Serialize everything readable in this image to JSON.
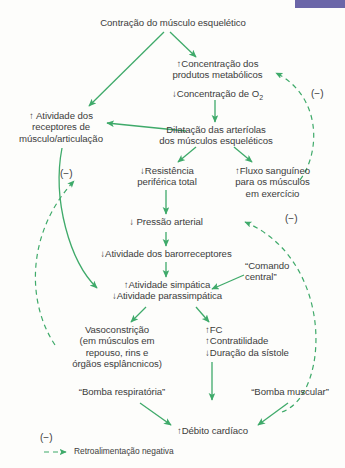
{
  "figure": {
    "title_bar_color": "#6b66a8",
    "arrow_color": "#3faa6a",
    "text_color": "#3c3c3c",
    "background": "#fdfdfb"
  },
  "nodes": {
    "contracao": "Contração do músculo esquelético",
    "produtos_metabolicos": "↑Concentração dos\nprodutos metabólicos",
    "concentracao_o2_pre": "↓Concentração de O",
    "concentracao_o2_sub": "2",
    "receptores": "↑ Atividade dos\nreceptores de\nmúsculo/articulação",
    "dilatacao": "Dilatação das arteríolas\ndos músculos esqueléticos",
    "resistencia": "↓Resistência\nperiférica total",
    "fluxo": "↑Fluxo sanguíneo\npara os músculos\nem exercício",
    "pressao_arterial": "↓ Pressão arterial",
    "barorreceptores": "↓Atividade dos barorreceptores",
    "simpatica": "↑Atividade simpática\n↓Atividade parassimpática",
    "comando_central": "“Comando\ncentral”",
    "vasoconstricao": "Vasoconstrição\n(em músculos em\nrepouso, rins e\nórgãos esplâncnicos)",
    "cardiaco_efeitos": "↑FC\n↑Contratilidade\n↓Duração da sístole",
    "bomba_respiratoria": "“Bomba respiratória”",
    "bomba_muscular": "“Bomba muscular”",
    "debito_cardiaco": "↑Débito cardíaco"
  },
  "minus_signs": {
    "m1": "(−)",
    "m2": "(−)",
    "m3": "(−)",
    "m4": "(−)"
  },
  "legend": {
    "minus": "(−)",
    "label": "Retroalimentação negativa"
  }
}
